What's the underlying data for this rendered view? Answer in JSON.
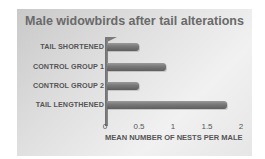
{
  "chart_data": {
    "type": "bar",
    "orientation": "horizontal",
    "title": "Male widowbirds after tail alterations",
    "categories": [
      "TAIL SHORTENED",
      "CONTROL GROUP 1",
      "CONTROL GROUP 2",
      "TAIL LENGTHENED"
    ],
    "values": [
      0.5,
      0.9,
      0.5,
      1.8
    ],
    "xlabel": "MEAN NUMBER OF NESTS PER MALE",
    "ylabel": "",
    "xlim": [
      0,
      2
    ],
    "ticks": [
      "0",
      "0.5",
      "1",
      "1.5",
      "2"
    ],
    "grid": false,
    "legend": null
  },
  "colors": {
    "bar": "#7a7a7a",
    "background": "#e2e2e2",
    "title": "#6a6a6a"
  }
}
